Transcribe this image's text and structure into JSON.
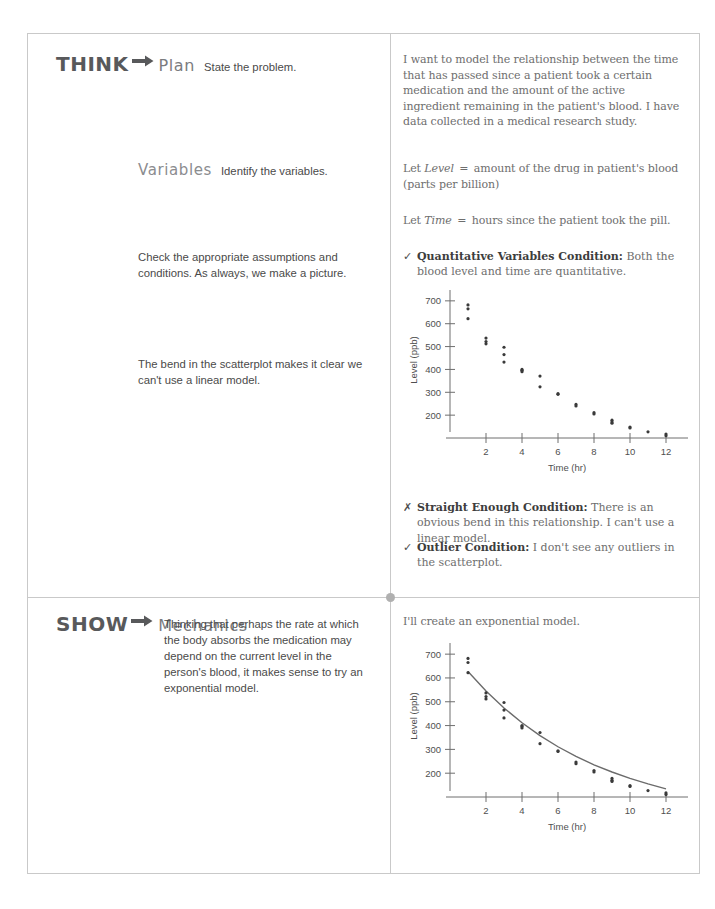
{
  "think": {
    "step_word": "THINK",
    "arrow_icon": "right-arrow-icon",
    "step_name": "Plan",
    "step_caption": "State the problem.",
    "statement": "I want to model the relationship between the time that has passed since a patient took a certain medication and the amount of the active ingredient remaining in the patient's blood. I have data collected in a medical research study.",
    "variables": {
      "heading": "Variables",
      "caption": "Identify the variables.",
      "let_level_prefix": "Let",
      "let_level_name": "Level",
      "let_level_eq": "=",
      "let_level_text": "amount of the drug in patient's blood (parts per billion)",
      "let_time_prefix": "Let",
      "let_time_name": "Time",
      "let_time_eq": "=",
      "let_time_text": "hours since the patient took the pill."
    },
    "assumptions_note": "Check the appropriate assumptions and conditions. As always, we make a picture.",
    "bend_note": "The bend in the scatterplot makes it clear we can't use a linear model.",
    "conditions": [
      {
        "mark": "✓",
        "mark_icon": "checkmark-icon",
        "name": "Quantitative Variables Condition:",
        "text": " Both the blood level and time are quantitative."
      },
      {
        "mark": "✗",
        "mark_icon": "cross-icon",
        "name": "Straight Enough Condition:",
        "text": " There is an obvious bend in this relationship. I can't use a linear model."
      },
      {
        "mark": "✓",
        "mark_icon": "checkmark-icon",
        "name": "Outlier Condition:",
        "text": " I don't see any outliers in the scatterplot."
      }
    ]
  },
  "show": {
    "step_word": "SHOW",
    "arrow_icon": "right-arrow-icon",
    "step_name": "Mechanics",
    "step_caption": "Thinking that perhaps the rate at which the body absorbs the medication may depend on the current level in the person's blood, it makes sense to try an exponential model.",
    "model_note": "I'll create an exponential model."
  },
  "chart_data": [
    {
      "id": "scatterplot-drug-level",
      "type": "scatter",
      "title": "",
      "xlabel": "Time (hr)",
      "ylabel": "Level (ppb)",
      "xlim": [
        0,
        13
      ],
      "ylim": [
        100,
        730
      ],
      "xticks": [
        2,
        4,
        6,
        8,
        10,
        12
      ],
      "yticks": [
        200,
        300,
        400,
        500,
        600,
        700
      ],
      "grid": false,
      "legend": "none",
      "fit_curve": false,
      "x": [
        1,
        1,
        1,
        2,
        2,
        2,
        3,
        3,
        3,
        4,
        4,
        4,
        5,
        5,
        6,
        6,
        7,
        7,
        8,
        8,
        9,
        9,
        9,
        10,
        10,
        11,
        12,
        12
      ],
      "y": [
        682,
        665,
        622,
        537,
        522,
        512,
        497,
        465,
        432,
        400,
        396,
        390,
        371,
        324,
        294,
        291,
        247,
        240,
        211,
        205,
        178,
        170,
        165,
        148,
        144,
        127,
        117,
        110
      ]
    },
    {
      "id": "scatterplot-with-exponential-fit",
      "type": "scatter",
      "title": "",
      "xlabel": "Time (hr)",
      "ylabel": "Level (ppb)",
      "xlim": [
        0,
        13
      ],
      "ylim": [
        100,
        730
      ],
      "xticks": [
        2,
        4,
        6,
        8,
        10,
        12
      ],
      "yticks": [
        200,
        300,
        400,
        500,
        600,
        700
      ],
      "grid": false,
      "legend": "none",
      "fit_curve": true,
      "fit_label": "exponential model",
      "x": [
        1,
        1,
        1,
        2,
        2,
        2,
        3,
        3,
        3,
        4,
        4,
        4,
        5,
        5,
        6,
        6,
        7,
        7,
        8,
        8,
        9,
        9,
        9,
        10,
        10,
        11,
        12,
        12
      ],
      "y": [
        682,
        665,
        622,
        537,
        522,
        512,
        497,
        465,
        432,
        400,
        396,
        390,
        371,
        324,
        294,
        291,
        247,
        240,
        211,
        205,
        178,
        170,
        165,
        148,
        144,
        127,
        117,
        110
      ],
      "fit_x": [
        1,
        2,
        3,
        4,
        5,
        6,
        7,
        8,
        9,
        10,
        11,
        12
      ],
      "fit_y": [
        627,
        545,
        474,
        412,
        358,
        311,
        271,
        235,
        205,
        178,
        155,
        134
      ]
    }
  ]
}
